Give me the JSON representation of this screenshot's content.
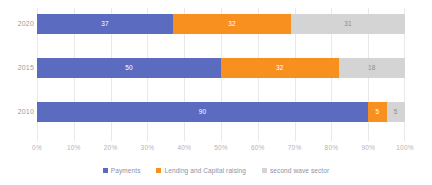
{
  "chart_data": {
    "type": "bar",
    "orientation": "horizontal",
    "stacked": true,
    "stack_mode": "percent",
    "title": "",
    "subtitle": "",
    "xlabel": "",
    "ylabel": "",
    "xlim": [
      0,
      100
    ],
    "grid": true,
    "legend_position": "bottom",
    "categories": [
      "2020",
      "2015",
      "2010"
    ],
    "tick_labels": [
      "0%",
      "10%",
      "20%",
      "30%",
      "40%",
      "50%",
      "60%",
      "70%",
      "80%",
      "90%",
      "100%"
    ],
    "tick_values": [
      0,
      10,
      20,
      30,
      40,
      50,
      60,
      70,
      80,
      90,
      100
    ],
    "series": [
      {
        "name": "Payments",
        "color": "#5B6BC0",
        "values": [
          37,
          50,
          90
        ]
      },
      {
        "name": "Lending and Capital raising",
        "color": "#F7901E",
        "values": [
          32,
          32,
          5
        ]
      },
      {
        "name": "second wave sector",
        "color": "#D4D4D4",
        "values": [
          31,
          18,
          5
        ]
      }
    ]
  },
  "axis": {
    "category_labels": [
      "2020",
      "2015",
      "2010"
    ]
  },
  "legend": {
    "items": [
      {
        "label": "Payments",
        "color": "#5B6BC0"
      },
      {
        "label": "Lending and Capital raising",
        "color": "#F7901E"
      },
      {
        "label": "second wave sector",
        "color": "#D4D4D4"
      }
    ]
  },
  "colors": {
    "payments": "#5B6BC0",
    "lending": "#F7901E",
    "second_wave": "#D4D4D4",
    "gridline": "#e9e9e9",
    "tick_text": "#b4b4b4",
    "category_text": "#9b9b9b",
    "legend_text": "#8e8fa8"
  },
  "labels": {
    "row_2020": [
      "37",
      "32",
      "31"
    ],
    "row_2015": [
      "50",
      "32",
      "18"
    ],
    "row_2010": [
      "90",
      "5",
      "5"
    ]
  }
}
